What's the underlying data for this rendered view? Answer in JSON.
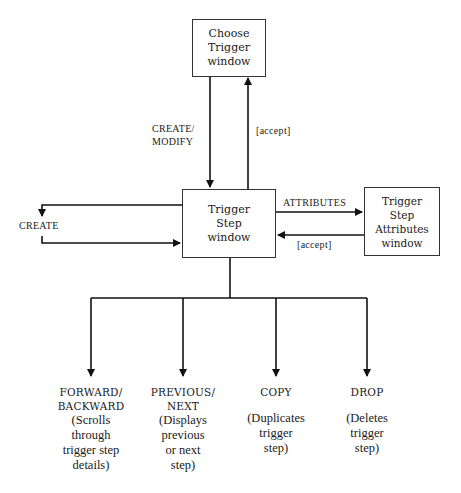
{
  "boxes": {
    "choose_trigger": "Choose\nTrigger\nwindow",
    "trigger_step": "Trigger\nStep\nwindow",
    "trigger_step_attributes": "Trigger\nStep\nAttributes\nwindow"
  },
  "edges": {
    "create_modify": "CREATE/\nMODIFY",
    "accept_up": "[accept]",
    "create_loop": "CREATE",
    "attributes": "ATTRIBUTES",
    "accept_back": "[accept]"
  },
  "actions": [
    {
      "command": "FORWARD/\nBACKWARD",
      "description": "(Scrolls\nthrough\ntrigger step\ndetails)"
    },
    {
      "command": "PREVIOUS/\nNEXT",
      "description": "(Displays\nprevious\nor next\nstep)"
    },
    {
      "command": "COPY",
      "description": "(Duplicates\ntrigger\nstep)"
    },
    {
      "command": "DROP",
      "description": "(Deletes\ntrigger\nstep)"
    }
  ]
}
